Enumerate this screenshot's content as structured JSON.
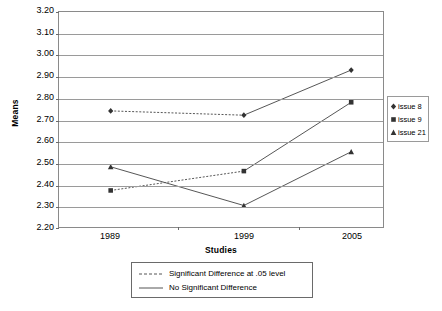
{
  "chart_data": {
    "type": "line",
    "title": "",
    "xlabel": "Studies",
    "ylabel": "Means",
    "categories": [
      "1989",
      "1999",
      "2005"
    ],
    "ylim": [
      2.2,
      3.2
    ],
    "ytick_step": 0.1,
    "ytick_labels": [
      "3.20",
      "3.10",
      "3.00",
      "2.90",
      "2.80",
      "2.70",
      "2.60",
      "2.50",
      "2.40",
      "2.30",
      "2.20"
    ],
    "grid": true,
    "legend_position": "right",
    "series": [
      {
        "name": "issue 8",
        "marker": "diamond",
        "values": [
          2.74,
          2.72,
          2.93
        ],
        "segment_styles": [
          "dashed",
          "solid"
        ]
      },
      {
        "name": "issue 9",
        "marker": "square",
        "values": [
          2.37,
          2.46,
          2.78
        ],
        "segment_styles": [
          "dashed",
          "solid"
        ]
      },
      {
        "name": "issue 21",
        "marker": "triangle",
        "values": [
          2.48,
          2.3,
          2.55
        ],
        "segment_styles": [
          "solid",
          "solid"
        ]
      }
    ],
    "style_legend": [
      {
        "style": "dashed",
        "label": "Significant Difference at .05 level"
      },
      {
        "style": "solid",
        "label": "No Significant Difference"
      }
    ]
  },
  "colors": {
    "line": "#555555",
    "grid": "#9a9a9a",
    "axis": "#8a8a8a",
    "text": "#000000",
    "background": "#ffffff"
  }
}
